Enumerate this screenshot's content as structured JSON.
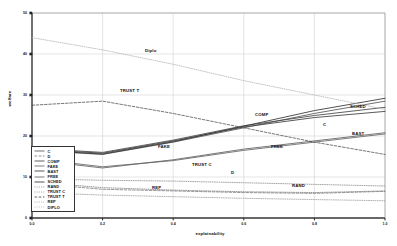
{
  "chart_data": {
    "type": "line",
    "title": "",
    "xlabel": "explainability",
    "ylabel": "welfare",
    "xlim": [
      0.0,
      1.0
    ],
    "ylim": [
      0,
      50
    ],
    "xticks": [
      "0.0",
      "0.2",
      "0.4",
      "0.6",
      "0.8",
      "1.0"
    ],
    "yticks": [
      "0",
      "10",
      "20",
      "30",
      "40",
      "50"
    ],
    "grid": true,
    "legend_position": "lower-left-inside",
    "x": [
      0.0,
      0.2,
      0.4,
      0.6,
      0.8,
      1.0
    ],
    "series": [
      {
        "name": "C",
        "style": "solid",
        "color": "#555555",
        "values": [
          16.5,
          15.5,
          18.5,
          22.0,
          25.5,
          28.5
        ]
      },
      {
        "name": "D",
        "style": "dashed",
        "color": "#777777",
        "values": [
          8.5,
          7.0,
          6.6,
          6.2,
          6.0,
          6.5
        ]
      },
      {
        "name": "COMP",
        "style": "solid",
        "color": "#444444",
        "values": [
          17.0,
          16.0,
          19.0,
          22.5,
          25.0,
          27.0
        ]
      },
      {
        "name": "FAKE",
        "style": "solid",
        "color": "#666666",
        "values": [
          14.5,
          12.5,
          14.0,
          16.5,
          18.5,
          20.5
        ]
      },
      {
        "name": "BAST",
        "style": "solid",
        "color": "#3c3c3c",
        "values": [
          16.8,
          15.8,
          18.8,
          22.2,
          24.5,
          26.0
        ]
      },
      {
        "name": "FREE",
        "style": "solid",
        "color": "#606060",
        "values": [
          14.2,
          12.2,
          14.2,
          16.8,
          18.8,
          20.8
        ]
      },
      {
        "name": "SCHED",
        "style": "solid",
        "color": "#333333",
        "values": [
          16.6,
          15.6,
          18.6,
          22.4,
          26.2,
          29.2
        ]
      },
      {
        "name": "RAND",
        "style": "dotted",
        "color": "#7a7a7a",
        "values": [
          8.8,
          7.4,
          6.8,
          6.4,
          6.2,
          6.6
        ]
      },
      {
        "name": "TRUST C",
        "style": "dotted",
        "color": "#8a8a8a",
        "values": [
          9.6,
          9.2,
          9.0,
          8.6,
          8.2,
          7.8
        ]
      },
      {
        "name": "TRUST T",
        "style": "dashed",
        "color": "#4a4a4a",
        "values": [
          27.5,
          28.5,
          25.5,
          22.0,
          18.5,
          15.5
        ]
      },
      {
        "name": "REP",
        "style": "dotted",
        "color": "#9a9a9a",
        "values": [
          6.2,
          5.6,
          5.2,
          4.8,
          4.5,
          4.2
        ]
      },
      {
        "name": "DIPLO",
        "style": "dotted",
        "color": "#b0b0b0",
        "values": [
          44.0,
          41.0,
          37.5,
          33.5,
          30.0,
          26.5
        ]
      }
    ],
    "annotations": [
      {
        "text": "Diplo",
        "x": 145,
        "y": 48
      },
      {
        "text": "TRUST T",
        "x": 120,
        "y": 88
      },
      {
        "text": "COMP",
        "x": 255,
        "y": 112
      },
      {
        "text": "C",
        "x": 323,
        "y": 122
      },
      {
        "text": "SCHED",
        "x": 350,
        "y": 104
      },
      {
        "text": "BAST",
        "x": 352,
        "y": 131
      },
      {
        "text": "FAKE",
        "x": 158,
        "y": 144
      },
      {
        "text": "FREE",
        "x": 271,
        "y": 144
      },
      {
        "text": "TRUST C",
        "x": 192,
        "y": 162
      },
      {
        "text": "D",
        "x": 231,
        "y": 170
      },
      {
        "text": "RAND",
        "x": 292,
        "y": 183
      },
      {
        "text": "REP",
        "x": 152,
        "y": 185
      }
    ]
  }
}
